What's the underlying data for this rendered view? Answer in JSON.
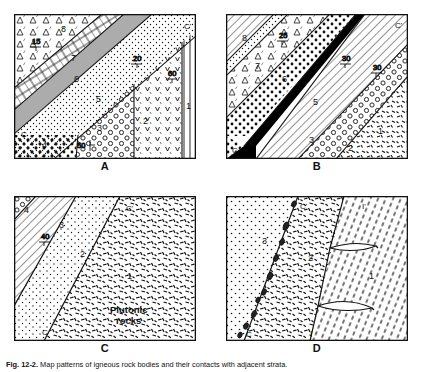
{
  "figure": {
    "caption_label": "Fig. 12-2.",
    "caption_text": "Map patterns of igneous rock bodies and their contacts with adjacent strata.",
    "background_color": "#ffffff",
    "line_color": "#111111",
    "black_unit_color": "#000000"
  },
  "panels": [
    {
      "id": "A",
      "letter": "A",
      "section_line_labels": {
        "left": "C",
        "right": "C'"
      },
      "unit_labels": [
        "8",
        "7",
        "6",
        "5",
        "4",
        "3",
        "2",
        "1"
      ],
      "dip_values": [
        "15",
        "20",
        "50",
        "60"
      ],
      "units": [
        {
          "number": "8",
          "pattern": "triangle-conglomerate"
        },
        {
          "number": "7",
          "pattern": "brick-limestone"
        },
        {
          "number": "6",
          "pattern": "shale-lines"
        },
        {
          "number": "5",
          "pattern": "fine-stipple"
        },
        {
          "number": "4",
          "pattern": "coarse-dots"
        },
        {
          "number": "3",
          "pattern": "circles-conglomerate"
        },
        {
          "number": "2",
          "pattern": "v-pattern-volcanic"
        },
        {
          "number": "1",
          "pattern": "vertical-lines"
        }
      ]
    },
    {
      "id": "B",
      "letter": "B",
      "section_line_labels": {
        "left": "C",
        "right": "C'"
      },
      "unit_labels": [
        "8",
        "7",
        "6",
        "5",
        "4",
        "3",
        "2",
        "1"
      ],
      "dip_values": [
        "25",
        "30",
        "30"
      ],
      "units": [
        {
          "number": "8",
          "pattern": "diagonal-hatch"
        },
        {
          "number": "7",
          "pattern": "fine-stipple"
        },
        {
          "number": "6",
          "pattern": "triangle-conglomerate"
        },
        {
          "number": "5",
          "pattern": "coarse-dots"
        },
        {
          "number": "4",
          "pattern": "solid-black-dike"
        },
        {
          "number": "3",
          "pattern": "diagonal-hatch"
        },
        {
          "number": "2",
          "pattern": "circles-conglomerate"
        },
        {
          "number": "1",
          "pattern": "dash-metamorphic"
        }
      ]
    },
    {
      "id": "C",
      "letter": "C",
      "section_line_labels": {
        "left": "C",
        "right": "C'"
      },
      "unit_labels": [
        "4",
        "3",
        "2",
        "1"
      ],
      "dip_values": [
        "40"
      ],
      "body_label": "Plutonic rocks",
      "units": [
        {
          "number": "4",
          "pattern": "circles-conglomerate"
        },
        {
          "number": "3",
          "pattern": "diagonal-hatch"
        },
        {
          "number": "2",
          "pattern": "fine-stipple"
        },
        {
          "number": "1",
          "pattern": "dash-plutonic"
        }
      ]
    },
    {
      "id": "D",
      "letter": "D",
      "section_line_labels": {
        "left": "C",
        "right": "C'",
        "left2": "I",
        "right2": "I'"
      },
      "unit_labels": [
        "3",
        "2",
        "1"
      ],
      "dip_values": [],
      "units": [
        {
          "number": "3",
          "pattern": "fine-stipple"
        },
        {
          "number": "2",
          "pattern": "dash-plutonic"
        },
        {
          "number": "1",
          "pattern": "inclined-dash-schist"
        }
      ],
      "inclusions_note": "xenolith-chain"
    }
  ]
}
